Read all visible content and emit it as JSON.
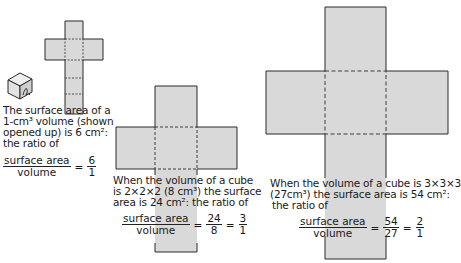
{
  "figure": {
    "small": {
      "caption": [
        "The surface area of a",
        "1-cm³ volume (shown",
        "opened up) is 6 cm²:",
        "the ratio of"
      ],
      "frac_num": "surface area",
      "frac_den": "volume",
      "ratio_num": "6",
      "ratio_den": "1"
    },
    "medium": {
      "caption": [
        "When the volume of a cube",
        "is 2×2×2 (8 cm³) the surface",
        "area is 24 cm²: the ratio of"
      ],
      "frac_num": "surface area",
      "frac_den": "volume",
      "val_num": "24",
      "val_den": "8",
      "ratio_num": "3",
      "ratio_den": "1"
    },
    "large": {
      "caption": [
        "When the volume of a cube is 3×3×3",
        "(27cm³) the surface area is 54 cm²:",
        "the ratio of"
      ],
      "frac_num": "surface area",
      "frac_den": "volume",
      "val_num": "54",
      "val_den": "27",
      "ratio_num": "2",
      "ratio_den": "1"
    },
    "colors": {
      "fill": "#d9d9d9",
      "stroke": "#2a2a2a"
    }
  }
}
